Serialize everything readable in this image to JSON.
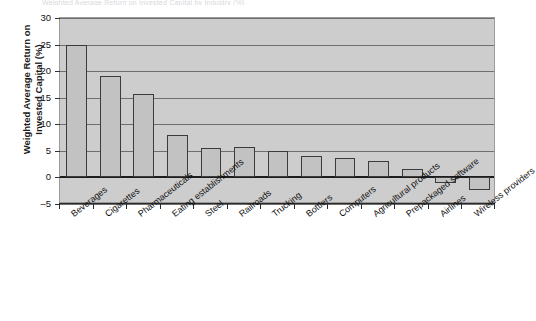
{
  "title_clipped": "Weighted Average Return on Invested Capital by Industry (%)",
  "chart_data": {
    "type": "bar",
    "title": "",
    "xlabel": "",
    "ylabel": "Weighted Average Return on Invested Capital (%)",
    "ylabel_line1": "Weighted Average Return on",
    "ylabel_line2": "Invested Capital (%)",
    "ylim": [
      -5,
      30
    ],
    "yticks": [
      30,
      25,
      20,
      15,
      10,
      5,
      0,
      -5
    ],
    "ytick_labels": [
      "30",
      "25",
      "20",
      "15",
      "10",
      "5",
      "0",
      "–5"
    ],
    "grid": true,
    "legend": "none",
    "categories": [
      "Beverages",
      "Cigarettes",
      "Pharmaceuticals",
      "Eating establishments",
      "Steel",
      "Railroads",
      "Trucking",
      "Bottlers",
      "Computers",
      "Agricultural products",
      "Prepackaged software",
      "Airlines",
      "Wireless providers"
    ],
    "values": [
      25.0,
      19.0,
      15.7,
      8.0,
      5.6,
      5.7,
      5.0,
      4.0,
      3.7,
      3.0,
      1.5,
      -1.1,
      -2.3
    ],
    "colors": {
      "bar_fill": "#c2c2c2",
      "bar_edge": "#3b3b3b",
      "plot_background": "#cdcdcd",
      "gridline": "#6f6f6f",
      "zero_line": "#1d1d1d",
      "axis": "#2a2a2a",
      "text": "#111111"
    }
  }
}
